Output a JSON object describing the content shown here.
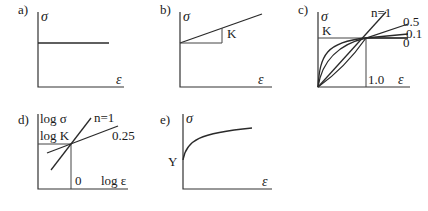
{
  "figure": {
    "panels": [
      {
        "id": "a",
        "label": "a)",
        "ylabel": "σ",
        "xlabel": "ε",
        "description": "rigid perfectly plastic: constant stress"
      },
      {
        "id": "b",
        "label": "b)",
        "ylabel": "σ",
        "xlabel": "ε",
        "slope_label": "K",
        "description": "linear hardening with slope K"
      },
      {
        "id": "c",
        "label": "c)",
        "ylabel": "σ",
        "xlabel": "ε",
        "k_label": "K",
        "x_tick": "1.0",
        "curves": [
          "n=1",
          "0.5",
          "0.1",
          "0"
        ],
        "description": "power law σ = Kε^n for various n"
      },
      {
        "id": "d",
        "label": "d)",
        "ylabel": "log σ",
        "xlabel": "log ε",
        "k_label": "log K",
        "x_tick": "0",
        "curves": [
          "n=1",
          "0.25"
        ],
        "description": "log-log plot of power law"
      },
      {
        "id": "e",
        "label": "e)",
        "ylabel": "σ",
        "xlabel": "ε",
        "y_label_mark": "Y",
        "description": "hardening curve starting at yield stress Y"
      }
    ]
  }
}
